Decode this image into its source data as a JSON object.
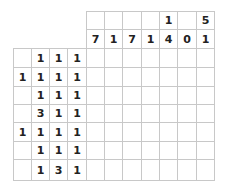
{
  "puzzle": {
    "type": "nonogram",
    "column_clues": [
      [
        "",
        "7"
      ],
      [
        "",
        "1"
      ],
      [
        "",
        "7"
      ],
      [
        "",
        "1"
      ],
      [
        "1",
        "4"
      ],
      [
        "",
        "0"
      ],
      [
        "5",
        "1"
      ]
    ],
    "row_clues": [
      [
        "",
        "1",
        "1",
        "1"
      ],
      [
        "1",
        "1",
        "1",
        "1"
      ],
      [
        "",
        "1",
        "1",
        "1"
      ],
      [
        "",
        "3",
        "1",
        "1"
      ],
      [
        "1",
        "1",
        "1",
        "1"
      ],
      [
        "",
        "1",
        "1",
        "1"
      ],
      [
        "",
        "1",
        "3",
        "1"
      ]
    ],
    "rows": 7,
    "cols": 7,
    "grid_line_color": "#c8c8c8",
    "text_color": "#222222"
  }
}
